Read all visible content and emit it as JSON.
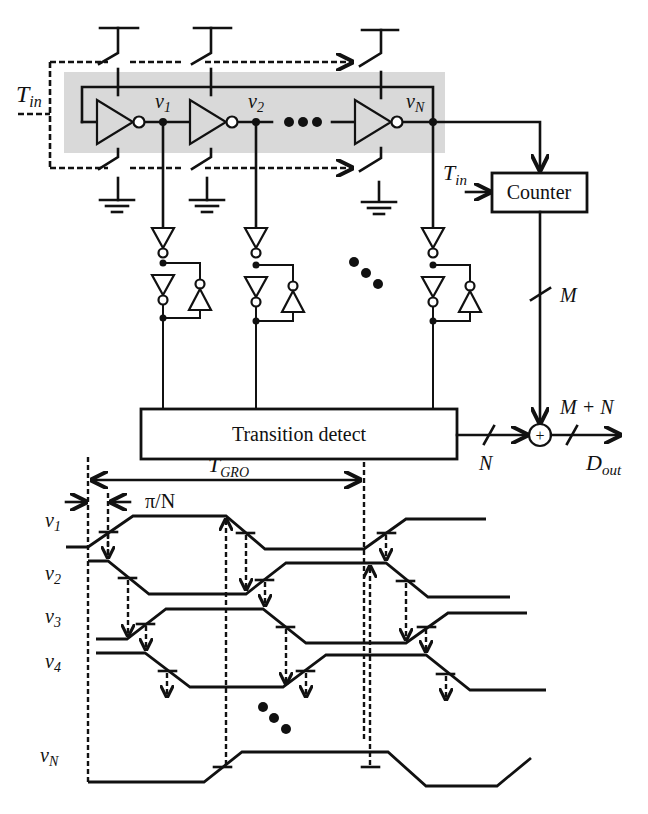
{
  "figure": {
    "type": "circuit-and-timing-diagram",
    "colors": {
      "ink": "#111111",
      "ring_band": "#d9d9d9",
      "background": "#ffffff"
    }
  },
  "circuit": {
    "input_label": "T",
    "input_label_sub": "in",
    "ring_nodes": [
      {
        "label": "v",
        "sub": "1"
      },
      {
        "label": "v",
        "sub": "2"
      },
      {
        "label": "v",
        "sub": "N"
      }
    ],
    "ellipsis": "•••",
    "counter": {
      "label": "Counter",
      "input_label": "T",
      "input_label_sub": "in"
    },
    "transition_detect": {
      "label": "Transition detect"
    },
    "buses": {
      "counter_out": "M",
      "detect_out": "N",
      "sum_out": "M + N"
    },
    "adder_symbol": "+",
    "output_label": "D",
    "output_label_sub": "out"
  },
  "timing": {
    "period_label": "T",
    "period_label_sub": "GRO",
    "phase_step_label": "π/N",
    "signals": [
      {
        "label": "v",
        "sub": "1"
      },
      {
        "label": "v",
        "sub": "2"
      },
      {
        "label": "v",
        "sub": "3"
      },
      {
        "label": "v",
        "sub": "4"
      },
      {
        "label": "v",
        "sub": "N"
      }
    ],
    "ellipsis": "•••"
  }
}
